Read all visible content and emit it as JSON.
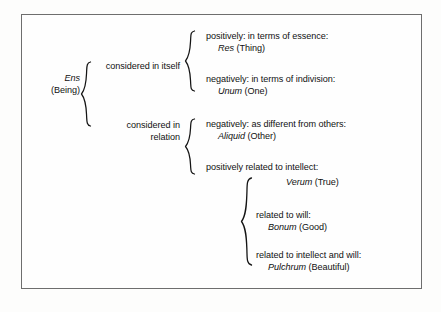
{
  "diagram": {
    "root": {
      "latin": "Ens",
      "gloss": "(Being)"
    },
    "branches": [
      {
        "label_line1": "considered in itself",
        "label_line2": "",
        "children": [
          {
            "description": "positively: in terms of essence:",
            "latin": "Res",
            "gloss": "(Thing)"
          },
          {
            "description": "negatively: in terms of indivision:",
            "latin": "Unum",
            "gloss": "(One)"
          }
        ]
      },
      {
        "label_line1": "considered in",
        "label_line2": "relation",
        "children": [
          {
            "description": "negatively: as different from others:",
            "latin": "Aliquid",
            "gloss": "(Other)"
          },
          {
            "description": "positively related to intellect:",
            "latin": "Verum",
            "gloss": "(True)",
            "sub_children": [
              {
                "description": "related to will:",
                "latin": "Bonum",
                "gloss": "(Good)"
              },
              {
                "description": "related to intellect and will:",
                "latin": "Pulchrum",
                "gloss": "(Beautiful)"
              }
            ]
          }
        ]
      }
    ],
    "colors": {
      "ink": "#141414",
      "border": "#6e6e6e",
      "paper": "#fefefe",
      "page": "#fdfdfc"
    }
  }
}
